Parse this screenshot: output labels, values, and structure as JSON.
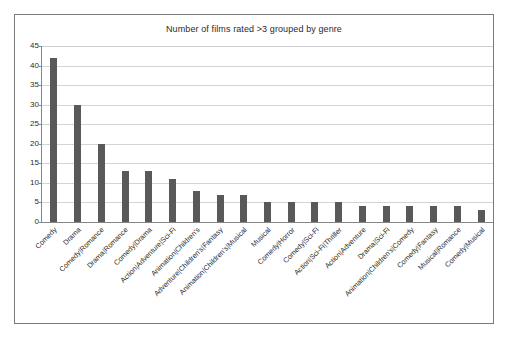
{
  "chart_data": {
    "type": "bar",
    "title": "Number of films rated >3 grouped by genre",
    "xlabel": "",
    "ylabel": "",
    "ylim": [
      0,
      45
    ],
    "ytick_step": 5,
    "yticks": [
      0,
      5,
      10,
      15,
      20,
      25,
      30,
      35,
      40,
      45
    ],
    "ytick_labels": [
      "0",
      "5",
      "10",
      "15",
      "20",
      "25",
      "30",
      "35",
      "40",
      "45"
    ],
    "grid": true,
    "legend": false,
    "legend_position": "none",
    "bar_color": "#595959",
    "orientation": "vertical",
    "categories": [
      "Comedy",
      "Drama",
      "Comedy|Romance",
      "Drama|Romance",
      "Comedy|Drama",
      "Action|Adventure|Sci-Fi",
      "Animation|Children's",
      "Adventure|Children's|Fantasy",
      "Animation|Children's|Musical",
      "Musical",
      "Comedy|Horror",
      "Comedy|Sci-Fi",
      "Action|Sci-Fi|Thriller",
      "Action|Adventure",
      "Drama|Sci-Fi",
      "Animation|Children's|Comedy",
      "Comedy|Fantasy",
      "Musical|Romance",
      "Comedy|Musical"
    ],
    "values": [
      42,
      30,
      20,
      13,
      13,
      11,
      8,
      7,
      7,
      5,
      5,
      5,
      5,
      4,
      4,
      4,
      4,
      4,
      3
    ]
  }
}
